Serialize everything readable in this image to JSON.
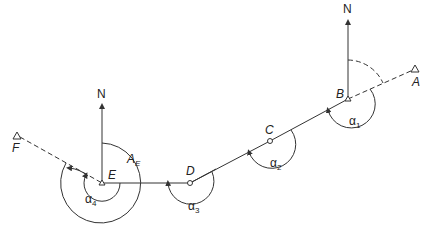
{
  "diagram": {
    "type": "traverse-bearing-diagram",
    "stations": [
      {
        "id": "A",
        "label": "A",
        "kind": "triangle-control"
      },
      {
        "id": "B",
        "label": "B",
        "kind": "traverse-station"
      },
      {
        "id": "C",
        "label": "C",
        "kind": "traverse-station"
      },
      {
        "id": "D",
        "label": "D",
        "kind": "traverse-station"
      },
      {
        "id": "E",
        "label": "E",
        "kind": "traverse-station"
      },
      {
        "id": "F",
        "label": "F",
        "kind": "triangle-control"
      }
    ],
    "north_arrows": [
      {
        "at": "E",
        "label": "N"
      },
      {
        "at": "B",
        "label": "N"
      }
    ],
    "angles": {
      "alpha1": {
        "symbol": "α",
        "sub": "1"
      },
      "alpha2": {
        "symbol": "α",
        "sub": "2"
      },
      "alpha3": {
        "symbol": "α",
        "sub": "3"
      },
      "alpha4": {
        "symbol": "α",
        "sub": "4"
      },
      "bearing_E": {
        "symbol": "A",
        "sub": "E"
      }
    }
  }
}
